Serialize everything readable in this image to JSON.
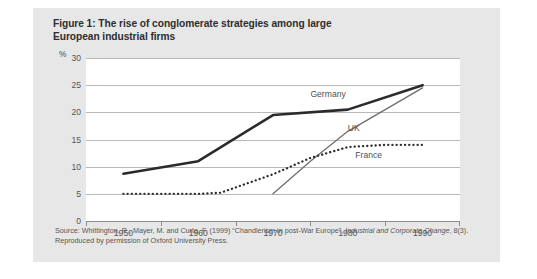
{
  "figure": {
    "title_line1": "Figure 1: The rise of conglomerate strategies among large",
    "title_line2": "European industrial firms",
    "y_unit": "%",
    "source_prefix": "Source: Whittington, R., Mayer, M. and Curto, F. (1999) “Chandlerism in post-War Europe”, ",
    "source_italic1": "Industrial and Corporate Change",
    "source_mid": ", 8(3). Reproduced by permission of Oxford University Press.",
    "card_color": "#e7e7e7",
    "plot_bg": "#ffffff",
    "grid_color": "#b9b9b9"
  },
  "chart_data": {
    "type": "line",
    "title": "Figure 1: The rise of conglomerate strategies among large European industrial firms",
    "xlabel": "",
    "ylabel": "%",
    "xlim": [
      1945,
      1995
    ],
    "ylim": [
      0,
      30
    ],
    "xticks": [
      1945,
      1955,
      1965,
      1975,
      1985,
      1995
    ],
    "xtick_labels": [
      "1950",
      "1960",
      "1970",
      "1980",
      "1990"
    ],
    "xtick_label_positions": [
      1950,
      1960,
      1970,
      1980,
      1990
    ],
    "yticks": [
      0,
      5,
      10,
      15,
      20,
      25,
      30
    ],
    "ytick_labels": [
      "0",
      "5",
      "10",
      "15",
      "20",
      "25",
      "30"
    ],
    "grid": "horizontal",
    "legend": "inline-labels",
    "series": [
      {
        "name": "Germany",
        "style": "thick-solid",
        "color": "#2b2b2b",
        "label_x": 1975,
        "label_y": 23.2,
        "x": [
          1950,
          1960,
          1970,
          1980,
          1990
        ],
        "values": [
          8.7,
          11.0,
          19.5,
          20.5,
          25.0
        ]
      },
      {
        "name": "UK",
        "style": "thin-solid",
        "color": "#6e6e6e",
        "label_x": 1980,
        "label_y": 17.0,
        "x": [
          1970,
          1975,
          1980,
          1990
        ],
        "values": [
          5.0,
          11.0,
          16.5,
          24.5
        ]
      },
      {
        "name": "France",
        "style": "dotted",
        "color": "#2b2b2b",
        "label_x": 1981,
        "label_y": 12.0,
        "x": [
          1950,
          1955,
          1960,
          1963,
          1970,
          1975,
          1980,
          1985,
          1990
        ],
        "values": [
          5.0,
          5.0,
          5.0,
          5.2,
          8.6,
          11.6,
          13.6,
          14.0,
          14.0
        ]
      }
    ]
  }
}
